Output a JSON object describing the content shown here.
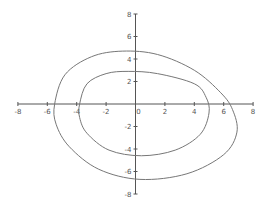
{
  "chart_data": {
    "type": "line",
    "title": "",
    "xlabel": "",
    "ylabel": "",
    "xlim": [
      -8,
      8
    ],
    "ylim": [
      -8,
      8
    ],
    "grid": false,
    "legend": null,
    "x_ticks": [
      -8,
      -6,
      -4,
      -2,
      0,
      2,
      4,
      6,
      8
    ],
    "y_ticks": [
      -8,
      -6,
      -4,
      -2,
      0,
      2,
      4,
      6,
      8
    ],
    "x_tick_labels": [
      "-8",
      "-6",
      "-4",
      "-2",
      "0",
      "2",
      "4",
      "6",
      "8"
    ],
    "y_tick_labels": [
      "-8",
      "-6",
      "-4",
      "-2",
      "2",
      "4",
      "6",
      "8"
    ],
    "series": [
      {
        "name": "outer closed curve",
        "shape": "tilted ellipse",
        "points": [
          [
            -5.5,
            0
          ],
          [
            -4.8,
            2.6
          ],
          [
            -3.0,
            4.2
          ],
          [
            -0.9,
            4.7
          ],
          [
            1.5,
            4.4
          ],
          [
            4.0,
            3.0
          ],
          [
            5.8,
            1.0
          ],
          [
            6.6,
            -0.5
          ],
          [
            6.9,
            -2.5
          ],
          [
            6.0,
            -4.5
          ],
          [
            3.5,
            -6.2
          ],
          [
            0.3,
            -6.7
          ],
          [
            -2.5,
            -5.8
          ],
          [
            -4.5,
            -3.8
          ],
          [
            -5.4,
            -1.8
          ],
          [
            -5.5,
            0
          ]
        ],
        "color": "#777777"
      },
      {
        "name": "inner closed curve",
        "shape": "tilted ellipse",
        "points": [
          [
            -3.8,
            0
          ],
          [
            -3.3,
            1.8
          ],
          [
            -2.0,
            2.7
          ],
          [
            -0.5,
            2.9
          ],
          [
            1.5,
            2.7
          ],
          [
            4.0,
            1.8
          ],
          [
            4.8,
            0.6
          ],
          [
            5.0,
            -0.8
          ],
          [
            4.4,
            -2.7
          ],
          [
            2.7,
            -4.1
          ],
          [
            0.4,
            -4.6
          ],
          [
            -1.8,
            -4.1
          ],
          [
            -3.3,
            -2.6
          ],
          [
            -3.8,
            -1.2
          ],
          [
            -3.8,
            0
          ]
        ],
        "color": "#777777"
      }
    ],
    "intersections": [
      [
        4.3,
        1.9
      ]
    ]
  },
  "colors": {
    "axis": "#555555",
    "curve": "#777777",
    "background": "#ffffff"
  }
}
